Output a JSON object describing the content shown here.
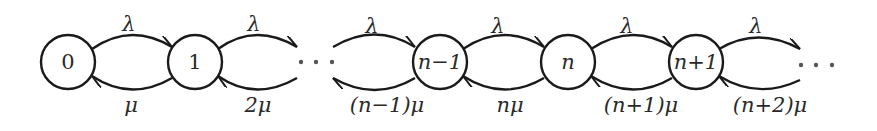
{
  "diagram": {
    "type": "birth-death-chain",
    "states": [
      {
        "id": "s0",
        "label": "0",
        "cx": 68
      },
      {
        "id": "s1",
        "label": "1",
        "cx": 195
      },
      {
        "id": "sn-1",
        "label": "n−1",
        "cx": 440
      },
      {
        "id": "sn",
        "label": "n",
        "cx": 568
      },
      {
        "id": "sn+1",
        "label": "n+1",
        "cx": 696
      }
    ],
    "ellipsis": "· · ·",
    "forward_rate": "λ",
    "forward_labels": [
      "λ",
      "λ",
      "λ",
      "λ",
      "λ",
      "λ"
    ],
    "backward_labels": [
      "μ",
      "2μ",
      "(n−1)μ",
      "nμ",
      "(n+1)μ",
      "(n+2)μ"
    ]
  }
}
